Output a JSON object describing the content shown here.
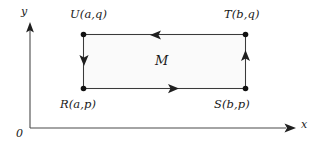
{
  "figure": {
    "background_color": "#ffffff",
    "stroke_color": "#2b2b2b",
    "fill_color": "#fafafa",
    "axes": {
      "y_label": "y",
      "x_label": "x",
      "origin_label": "0"
    },
    "region": {
      "label": "M"
    },
    "vertices": [
      {
        "key": "R",
        "label": "R(a,p)",
        "position": "bottom-left"
      },
      {
        "key": "S",
        "label": "S(b,p)",
        "position": "bottom-right"
      },
      {
        "key": "T",
        "label": "T(b,q)",
        "position": "top-right"
      },
      {
        "key": "U",
        "label": "U(a,q)",
        "position": "top-left"
      }
    ],
    "edges": [
      {
        "key": "bottom",
        "from": "R",
        "to": "S",
        "arrow_direction": "right"
      },
      {
        "key": "right",
        "from": "S",
        "to": "T",
        "arrow_direction": "up"
      },
      {
        "key": "top",
        "from": "T",
        "to": "U",
        "arrow_direction": "left"
      },
      {
        "key": "left",
        "from": "U",
        "to": "R",
        "arrow_direction": "down"
      }
    ]
  }
}
